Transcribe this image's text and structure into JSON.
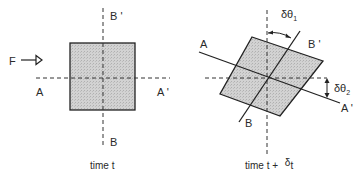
{
  "left_panel": {
    "force_label": "F",
    "axis_labels": {
      "A": "A",
      "A_prime": "A '",
      "B": "B",
      "B_prime": "B '"
    },
    "caption": "time t"
  },
  "right_panel": {
    "axis_labels": {
      "A": "A",
      "A_prime": "A '",
      "B": "B",
      "B_prime": "B '"
    },
    "angle1": {
      "symbol": "δθ",
      "subscript": "1"
    },
    "angle2": {
      "symbol": "δθ",
      "subscript": "2"
    },
    "caption_prefix": "time t + ",
    "caption_delta": "δ",
    "caption_suffix": "t"
  },
  "colors": {
    "fill": "#c9c9c9",
    "stroke": "#222222",
    "dash": "#333333"
  }
}
